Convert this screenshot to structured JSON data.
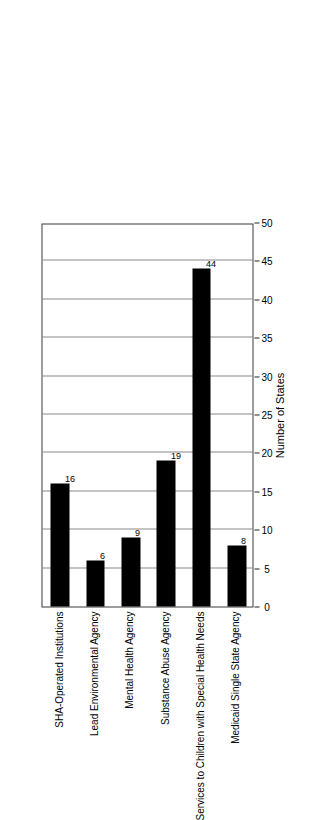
{
  "chart_data": {
    "type": "bar",
    "title": "",
    "subtitle": "",
    "orientation": "vertical-rotated",
    "categories": [
      "SHA-Operated Institutions",
      "Lead Environmental Agency",
      "Mental Health Agency",
      "Substance Abuse Agency",
      "Services to Children with Special Health Needs",
      "Medicaid Single State Agency"
    ],
    "values": [
      16,
      6,
      9,
      19,
      44,
      8
    ],
    "value_labels": [
      "16",
      "6",
      "9",
      "19",
      "44",
      "8"
    ],
    "xlabel": "",
    "ylabel": "Number of States",
    "ylim": [
      0,
      50
    ],
    "ticks": [
      0,
      5,
      10,
      15,
      20,
      25,
      30,
      35,
      40,
      45,
      50
    ],
    "tick_labels": [
      "0",
      "5",
      "10",
      "15",
      "20",
      "25",
      "30",
      "35",
      "40",
      "45",
      "50"
    ],
    "grid": true,
    "grid_axis": "value",
    "legend": false,
    "legend_position": "none",
    "bar_color": "#000000",
    "grid_color": "#8a8a8a",
    "frame_color": "#3a3a3a",
    "background_color": "#ffffff"
  },
  "axis": {
    "title": "Number of States"
  }
}
